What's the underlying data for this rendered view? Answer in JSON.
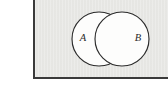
{
  "figure": {
    "kind": "venn-diagram",
    "panel": {
      "fill_color": "#e9e9e6",
      "border_color": "#3a3a3a",
      "borders_visible": [
        "left",
        "bottom"
      ]
    },
    "page_background_color": "#ffffff",
    "stroke_color": "#2b2b2b",
    "circle_fill_color": "#fdfdfc"
  },
  "sets": [
    {
      "id": "A",
      "label": "A",
      "label_x": 83,
      "label_y": 39,
      "center_x": 99,
      "center_y": 39,
      "radius": 27
    },
    {
      "id": "B",
      "label": "B",
      "label_x": 138,
      "label_y": 39,
      "center_x": 122,
      "center_y": 39,
      "radius": 27
    }
  ]
}
